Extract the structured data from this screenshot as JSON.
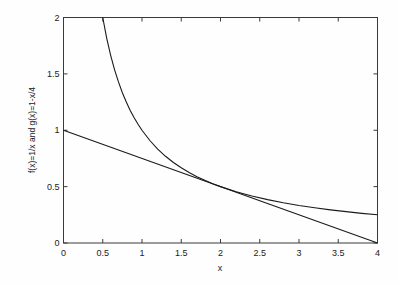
{
  "chart_data": {
    "type": "line",
    "title": "",
    "xlabel": "x",
    "ylabel": "f(x)=1/x  and  g(x)=1-x/4",
    "xlim": [
      0,
      4
    ],
    "ylim": [
      0,
      2
    ],
    "xticks": [
      "0",
      "0.5",
      "1",
      "1.5",
      "2",
      "2.5",
      "3",
      "3.5",
      "4"
    ],
    "xtick_values": [
      0,
      0.5,
      1,
      1.5,
      2,
      2.5,
      3,
      3.5,
      4
    ],
    "yticks": [
      "0",
      "0.5",
      "1",
      "1.5",
      "2"
    ],
    "ytick_values": [
      0,
      0.5,
      1,
      1.5,
      2
    ],
    "grid": false,
    "legend": "none",
    "box": true,
    "tick_direction": "in",
    "line_color": "#1a1a1a",
    "background_color": "#fefefe",
    "series": [
      {
        "name": "f(x)=1/x",
        "expression": "1/x",
        "x": [
          0.5,
          0.55,
          0.6,
          0.65,
          0.7,
          0.75,
          0.8,
          0.85,
          0.9,
          0.95,
          1.0,
          1.1,
          1.2,
          1.3,
          1.4,
          1.5,
          1.6,
          1.7,
          1.8,
          1.9,
          2.0,
          2.2,
          2.4,
          2.6,
          2.8,
          3.0,
          3.2,
          3.4,
          3.6,
          3.8,
          4.0
        ],
        "values": [
          2.0,
          1.818,
          1.667,
          1.538,
          1.429,
          1.333,
          1.25,
          1.176,
          1.111,
          1.053,
          1.0,
          0.909,
          0.833,
          0.769,
          0.714,
          0.667,
          0.625,
          0.588,
          0.556,
          0.526,
          0.5,
          0.455,
          0.417,
          0.385,
          0.357,
          0.333,
          0.313,
          0.294,
          0.278,
          0.263,
          0.25
        ]
      },
      {
        "name": "g(x)=1-x/4",
        "expression": "1-x/4",
        "x": [
          0,
          4
        ],
        "values": [
          1.0,
          0.0
        ]
      }
    ],
    "annotations": [
      {
        "label": "tangency point",
        "x": 2.0,
        "y": 0.5
      }
    ]
  }
}
